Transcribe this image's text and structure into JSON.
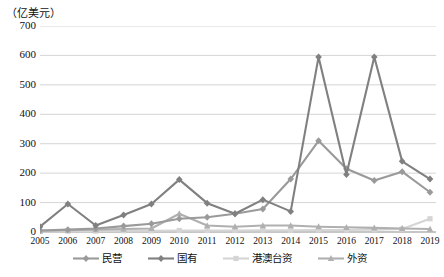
{
  "chart_data": {
    "type": "line",
    "title": "",
    "subtitle": "",
    "unit_label": "（亿美元）",
    "xlabel": "",
    "ylabel": "",
    "categories": [
      "2005",
      "2006",
      "2007",
      "2008",
      "2009",
      "2010",
      "2011",
      "2012",
      "2013",
      "2014",
      "2015",
      "2016",
      "2017",
      "2018",
      "2019"
    ],
    "ylim": [
      0,
      700
    ],
    "ytick_step": 100,
    "yticks": [
      "700",
      "600",
      "500",
      "400",
      "300",
      "200",
      "100",
      "0"
    ],
    "grid": true,
    "legend_position": "bottom",
    "series": [
      {
        "name": "民营",
        "color": "#9a9a9a",
        "marker": "diamond",
        "values": [
          5,
          8,
          12,
          20,
          28,
          45,
          50,
          62,
          78,
          180,
          310,
          215,
          175,
          205,
          135
        ]
      },
      {
        "name": "国有",
        "color": "#808080",
        "marker": "diamond",
        "values": [
          18,
          95,
          22,
          58,
          95,
          178,
          98,
          62,
          110,
          70,
          595,
          195,
          595,
          240,
          180
        ]
      },
      {
        "name": "港澳台资",
        "color": "#d5d5d5",
        "marker": "square",
        "values": [
          2,
          3,
          3,
          4,
          4,
          5,
          5,
          5,
          6,
          6,
          7,
          7,
          8,
          10,
          45
        ]
      },
      {
        "name": "外资",
        "color": "#b0b0b0",
        "marker": "triangle",
        "values": [
          4,
          6,
          8,
          10,
          12,
          62,
          22,
          18,
          22,
          22,
          18,
          16,
          14,
          12,
          10
        ]
      }
    ]
  },
  "legend": {
    "items": [
      {
        "label": "民营"
      },
      {
        "label": "国有"
      },
      {
        "label": "港澳台资"
      },
      {
        "label": "外资"
      }
    ]
  }
}
